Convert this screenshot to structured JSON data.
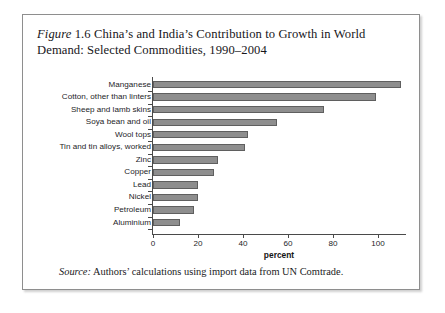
{
  "figure": {
    "label_italic": "Figure",
    "number": "1.6",
    "title_rest": "China’s and India’s Contribution to Growth in World Demand: Selected Commodities, 1990–2004",
    "title_full": "Figure 1.6 China’s and India’s Contribution to Growth in World Demand: Selected Commodities, 1990–2004",
    "source_label": "Source:",
    "source_text": "Authors’ calculations using import data from UN Comtrade.",
    "bar_color": "#8e8e8e",
    "bar_border_color": "#5f5f5f",
    "frame_color": "#8e8e8e",
    "axis_color": "#4a4a4a"
  },
  "chart_data": {
    "type": "bar",
    "orientation": "horizontal",
    "title": "Figure 1.6 China’s and India’s Contribution to Growth in World Demand: Selected Commodities, 1990–2004",
    "xlabel": "percent",
    "ylabel": "",
    "xlim": [
      0,
      113
    ],
    "xticks": [
      0,
      20,
      40,
      60,
      80,
      100
    ],
    "xtick_labels": [
      "0",
      "20",
      "40",
      "60",
      "80",
      "100"
    ],
    "grid": false,
    "legend": null,
    "categories": [
      "Manganese",
      "Cotton, other than linters",
      "Sheep and lamb skins",
      "Soya bean and oil",
      "Wool tops",
      "Tin and tin alloys, worked",
      "Zinc",
      "Copper",
      "Lead",
      "Nickel",
      "Petroleum",
      "Aluminium"
    ],
    "values": [
      110,
      99,
      76,
      55,
      42,
      41,
      29,
      27,
      20,
      20,
      18,
      12
    ],
    "series": [
      {
        "name": "percent",
        "values": [
          110,
          99,
          76,
          55,
          42,
          41,
          29,
          27,
          20,
          20,
          18,
          12
        ]
      }
    ]
  }
}
